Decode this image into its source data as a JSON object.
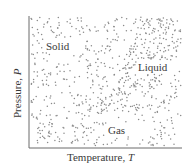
{
  "diagram": {
    "type": "phase-diagram",
    "x_axis": {
      "label": "Temperature,",
      "symbol": "T"
    },
    "y_axis": {
      "label": "Pressure,",
      "symbol": "P"
    },
    "regions": [
      {
        "name": "Solid",
        "label_x": 46,
        "label_y": 41,
        "density": "medium"
      },
      {
        "name": "Liquid",
        "label_x": 138,
        "label_y": 62,
        "density": "dense"
      },
      {
        "name": "Gas",
        "label_x": 108,
        "label_y": 125,
        "density": "medium"
      }
    ],
    "colors": {
      "dots": "#8a8a8a",
      "axis": "#6a6a6a",
      "text": "#3a3a3a",
      "background": "#ffffff"
    },
    "plot_area": {
      "left": 29,
      "top": 16,
      "right": 182,
      "bottom": 148
    }
  }
}
